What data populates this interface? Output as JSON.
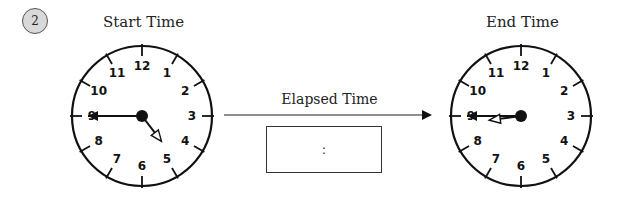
{
  "problem": {
    "number": "2"
  },
  "start_clock": {
    "title": "Start Time",
    "hour": 4,
    "minute": 45,
    "reading": "4:45"
  },
  "end_clock": {
    "title": "End Time",
    "hour": 8,
    "minute": 45,
    "reading": "8:45"
  },
  "clock_numbers": [
    "12",
    "1",
    "2",
    "3",
    "4",
    "5",
    "6",
    "7",
    "8",
    "9",
    "10",
    "11"
  ],
  "elapsed": {
    "label": "Elapsed Time",
    "answer_placeholder": ":"
  }
}
